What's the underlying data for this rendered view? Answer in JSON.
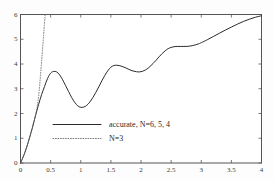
{
  "chart_data": {
    "type": "line",
    "title": "",
    "subtitle": "",
    "xlabel": "",
    "ylabel": "",
    "xlim": [
      0,
      4
    ],
    "ylim": [
      0,
      6
    ],
    "grid": false,
    "legend_position": "center-left",
    "x_tick_labels": [
      "0",
      "0.5",
      "1",
      "1.5",
      "2",
      "2.5",
      "3",
      "3.5",
      "4"
    ],
    "x_tick_values": [
      0,
      0.5,
      1,
      1.5,
      2,
      2.5,
      3,
      3.5,
      4
    ],
    "y_tick_labels": [
      "0",
      "1",
      "2",
      "3",
      "4",
      "5",
      "6"
    ],
    "y_tick_values": [
      0,
      1,
      2,
      3,
      4,
      5,
      6
    ],
    "series": [
      {
        "name": "accurate, N=6, 5, 4",
        "style": "solid",
        "color": "#2b2b2b",
        "x": [
          0.0,
          0.05,
          0.1,
          0.15,
          0.2,
          0.25,
          0.3,
          0.35,
          0.4,
          0.45,
          0.5,
          0.55,
          0.6,
          0.65,
          0.7,
          0.75,
          0.8,
          0.85,
          0.9,
          0.95,
          1.0,
          1.05,
          1.1,
          1.15,
          1.2,
          1.25,
          1.3,
          1.35,
          1.4,
          1.45,
          1.5,
          1.55,
          1.6,
          1.65,
          1.7,
          1.75,
          1.8,
          1.85,
          1.9,
          1.95,
          2.0,
          2.05,
          2.1,
          2.15,
          2.2,
          2.25,
          2.3,
          2.35,
          2.4,
          2.45,
          2.5,
          2.55,
          2.6,
          2.65,
          2.7,
          2.75,
          2.8,
          2.85,
          2.9,
          2.95,
          3.0,
          3.1,
          3.2,
          3.3,
          3.4,
          3.5,
          3.6,
          3.7,
          3.8,
          3.9,
          4.0
        ],
        "y": [
          0.0,
          0.28,
          0.62,
          1.02,
          1.45,
          1.92,
          2.36,
          2.76,
          3.1,
          3.42,
          3.63,
          3.7,
          3.68,
          3.56,
          3.36,
          3.12,
          2.88,
          2.64,
          2.45,
          2.31,
          2.25,
          2.26,
          2.33,
          2.46,
          2.64,
          2.85,
          3.08,
          3.32,
          3.54,
          3.73,
          3.87,
          3.94,
          3.95,
          3.93,
          3.89,
          3.84,
          3.78,
          3.73,
          3.7,
          3.68,
          3.69,
          3.73,
          3.8,
          3.9,
          4.02,
          4.15,
          4.29,
          4.42,
          4.53,
          4.62,
          4.67,
          4.7,
          4.71,
          4.71,
          4.71,
          4.71,
          4.72,
          4.74,
          4.77,
          4.81,
          4.86,
          4.98,
          5.11,
          5.24,
          5.37,
          5.49,
          5.61,
          5.72,
          5.81,
          5.89,
          5.95
        ]
      },
      {
        "name": "N=3",
        "style": "dotted",
        "color": "#6a6a6a",
        "x": [
          0.0,
          0.05,
          0.1,
          0.15,
          0.2,
          0.25,
          0.28,
          0.3,
          0.32,
          0.34,
          0.36,
          0.38,
          0.4,
          0.41
        ],
        "y": [
          0.0,
          0.28,
          0.62,
          1.02,
          1.45,
          1.94,
          2.32,
          2.68,
          3.2,
          3.8,
          4.4,
          5.05,
          5.7,
          6.0
        ]
      }
    ],
    "legend_entries": [
      {
        "label": "accurate, N=6, 5, 4",
        "style": "solid"
      },
      {
        "label": "N=3",
        "style": "dotted"
      }
    ]
  },
  "axes": {
    "frame_color": "#555555",
    "tick_color": "#555555",
    "background": "#fdfdfd"
  }
}
